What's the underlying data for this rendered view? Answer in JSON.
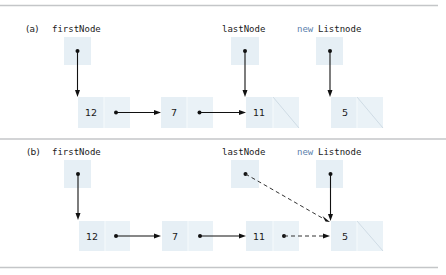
{
  "panels": [
    {
      "label": "(a)",
      "refs": {
        "first": "firstNode",
        "last": "lastNode",
        "new_keyword": "new",
        "new_type": "Listnode"
      },
      "nodes": [
        "12",
        "7",
        "11",
        "5"
      ],
      "links": [
        {
          "from": "firstNode",
          "to": "12",
          "style": "solid"
        },
        {
          "from": "12",
          "to": "7",
          "style": "solid"
        },
        {
          "from": "7",
          "to": "11",
          "style": "solid"
        },
        {
          "from": "lastNode",
          "to": "11",
          "style": "solid"
        },
        {
          "from": "new Listnode",
          "to": "5",
          "style": "solid"
        }
      ],
      "null_next": [
        "11",
        "5"
      ]
    },
    {
      "label": "(b)",
      "refs": {
        "first": "firstNode",
        "last": "lastNode",
        "new_keyword": "new",
        "new_type": "Listnode"
      },
      "nodes": [
        "12",
        "7",
        "11",
        "5"
      ],
      "links": [
        {
          "from": "firstNode",
          "to": "12",
          "style": "solid"
        },
        {
          "from": "12",
          "to": "7",
          "style": "solid"
        },
        {
          "from": "7",
          "to": "11",
          "style": "solid"
        },
        {
          "from": "11",
          "to": "5",
          "style": "dashed"
        },
        {
          "from": "lastNode",
          "to": "5",
          "style": "dashed"
        },
        {
          "from": "new Listnode",
          "to": "5",
          "style": "solid"
        }
      ],
      "null_next": [
        "5"
      ]
    }
  ],
  "colors": {
    "box_fill": "#e6eff5",
    "keyword": "#5b7fae",
    "rule": "#c4c6c8",
    "arrow": "#111111"
  }
}
